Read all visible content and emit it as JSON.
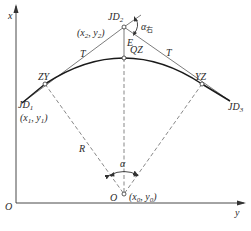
{
  "diagram": {
    "type": "circular-curve-geometry",
    "colors": {
      "line": "#333333",
      "dashed": "#555555",
      "curve": "#1a1a1a",
      "background": "#ffffff"
    },
    "axes": {
      "vertical_label": "x",
      "horizontal_label": "y",
      "origin_label": "O"
    },
    "points": {
      "jd1": {
        "label": "JD",
        "sub": "1",
        "coord_label": "(x",
        "coord_sub1": "1",
        "coord_mid": ", y",
        "coord_sub2": "1",
        "coord_end": ")"
      },
      "jd2": {
        "label": "JD",
        "sub": "2",
        "coord_label": "(x",
        "coord_sub1": "2",
        "coord_mid": ", y",
        "coord_sub2": "2",
        "coord_end": ")"
      },
      "jd3": {
        "label": "JD",
        "sub": "3"
      },
      "zy": {
        "label": "ZY"
      },
      "qz": {
        "label": "QZ"
      },
      "yz": {
        "label": "YZ"
      },
      "center": {
        "label": "O",
        "coord_label": "(x",
        "coord_sub1": "0",
        "coord_mid": ", y",
        "coord_sub2": "0",
        "coord_end": ")"
      }
    },
    "segments": {
      "tangent_left": "T",
      "tangent_right": "T",
      "external_distance": "E",
      "radius": "R"
    },
    "angles": {
      "central": "α",
      "deflection": "α",
      "deflection_sub": "右"
    }
  }
}
